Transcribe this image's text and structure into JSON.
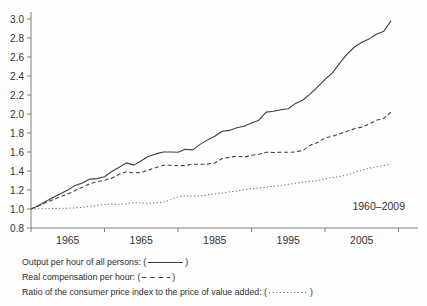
{
  "chart_data": {
    "type": "line",
    "title": "",
    "xlabel": "",
    "ylabel": "",
    "annotation": "1960–2009",
    "ylim": [
      0.8,
      3.0
    ],
    "xlim": [
      1960,
      2013
    ],
    "grid": false,
    "legend_position": "below-left",
    "axis_color": "#7d7d7d",
    "line_color": "#3f3f3f",
    "dotted_color": "#636363",
    "y_ticks": [
      0.8,
      1.0,
      1.2,
      1.4,
      1.6,
      1.8,
      2.0,
      2.2,
      2.4,
      2.6,
      2.8,
      3.0
    ],
    "y_tick_labels": [
      "0.8",
      "1.0",
      "1.2",
      "1.4",
      "1.6",
      "1.8",
      "2.0",
      "2.2",
      "2.4",
      "2.6",
      "2.8",
      "3.0"
    ],
    "x_tick_years": [
      1960,
      1970,
      1980,
      1990,
      2000,
      2010
    ],
    "x_label_years": [
      1965,
      1975,
      1985,
      1995,
      2005
    ],
    "x_tick_label_texts": [
      "1965",
      "1965",
      "1985",
      "1995",
      "2005"
    ],
    "x": [
      1960,
      1961,
      1962,
      1963,
      1964,
      1965,
      1966,
      1967,
      1968,
      1969,
      1970,
      1971,
      1972,
      1973,
      1974,
      1975,
      1976,
      1977,
      1978,
      1979,
      1980,
      1981,
      1982,
      1983,
      1984,
      1985,
      1986,
      1987,
      1988,
      1989,
      1990,
      1991,
      1992,
      1993,
      1994,
      1995,
      1996,
      1997,
      1998,
      1999,
      2000,
      2001,
      2002,
      2003,
      2004,
      2005,
      2006,
      2007,
      2008,
      2009
    ],
    "series": [
      {
        "name": "Output per hour of all persons",
        "line_style": "solid",
        "values": [
          1.0,
          1.035,
          1.08,
          1.12,
          1.16,
          1.2,
          1.248,
          1.273,
          1.315,
          1.32,
          1.34,
          1.395,
          1.44,
          1.485,
          1.462,
          1.508,
          1.555,
          1.58,
          1.6,
          1.6,
          1.598,
          1.628,
          1.622,
          1.68,
          1.727,
          1.765,
          1.818,
          1.827,
          1.855,
          1.87,
          1.905,
          1.935,
          2.02,
          2.03,
          2.045,
          2.055,
          2.112,
          2.147,
          2.212,
          2.285,
          2.365,
          2.43,
          2.535,
          2.63,
          2.705,
          2.755,
          2.79,
          2.84,
          2.87,
          2.98
        ]
      },
      {
        "name": "Real compensation per hour",
        "line_style": "dashed",
        "values": [
          1.0,
          1.032,
          1.068,
          1.098,
          1.13,
          1.157,
          1.195,
          1.228,
          1.266,
          1.285,
          1.303,
          1.325,
          1.365,
          1.392,
          1.38,
          1.383,
          1.412,
          1.436,
          1.461,
          1.46,
          1.456,
          1.458,
          1.472,
          1.471,
          1.473,
          1.484,
          1.532,
          1.543,
          1.558,
          1.548,
          1.565,
          1.576,
          1.598,
          1.595,
          1.597,
          1.597,
          1.6,
          1.618,
          1.672,
          1.7,
          1.748,
          1.765,
          1.792,
          1.818,
          1.845,
          1.862,
          1.895,
          1.935,
          1.955,
          2.02
        ]
      },
      {
        "name": "Ratio of the consumer price index to the price of value added",
        "line_style": "dotted",
        "values": [
          1.0,
          1.002,
          1.004,
          1.005,
          1.006,
          1.008,
          1.012,
          1.018,
          1.028,
          1.038,
          1.048,
          1.052,
          1.048,
          1.055,
          1.068,
          1.062,
          1.06,
          1.065,
          1.072,
          1.098,
          1.125,
          1.14,
          1.135,
          1.14,
          1.148,
          1.158,
          1.168,
          1.18,
          1.19,
          1.202,
          1.215,
          1.222,
          1.23,
          1.24,
          1.248,
          1.26,
          1.272,
          1.282,
          1.29,
          1.3,
          1.318,
          1.33,
          1.342,
          1.36,
          1.385,
          1.408,
          1.428,
          1.445,
          1.458,
          1.47
        ]
      }
    ]
  },
  "legend": {
    "open_paren": "(",
    "close_paren": ")",
    "items": [
      {
        "label": "Output per hour of all persons:",
        "style": "solid"
      },
      {
        "label": "Real compensation per hour:",
        "style": "dashed"
      },
      {
        "label": "Ratio of the consumer price index to the price of value added:",
        "style": "dotted"
      }
    ]
  }
}
